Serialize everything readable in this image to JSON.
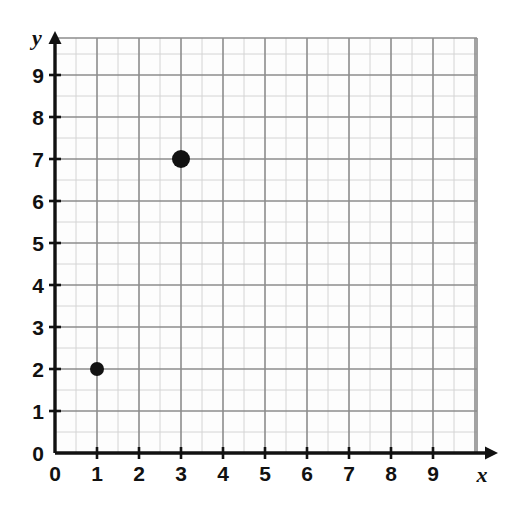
{
  "figure": {
    "title": "",
    "background_color": "#ffffff",
    "width": 507,
    "height": 506
  },
  "chart_data": {
    "type": "scatter",
    "title": "",
    "xlabel": "x",
    "ylabel": "y",
    "xlim": [
      0,
      10
    ],
    "ylim": [
      0,
      9.9
    ],
    "xticks": [
      0,
      1,
      2,
      3,
      4,
      5,
      6,
      7,
      8,
      9
    ],
    "yticks": [
      0,
      1,
      2,
      3,
      4,
      5,
      6,
      7,
      8,
      9
    ],
    "xtick_labels": [
      "0",
      "1",
      "2",
      "3",
      "4",
      "5",
      "6",
      "7",
      "8",
      "9"
    ],
    "ytick_labels": [
      "0",
      "1",
      "2",
      "3",
      "4",
      "5",
      "6",
      "7",
      "8",
      "9"
    ],
    "grid": true,
    "grid_major_step": 1,
    "grid_minor_step": 0.5,
    "legend": null,
    "series": [
      {
        "name": "plotted points",
        "marker": "filled-circle",
        "color": "#121212",
        "points": [
          {
            "label": "(1, 2)",
            "x": 1,
            "y": 2,
            "radius": 7
          },
          {
            "label": "(3, 7)",
            "x": 3,
            "y": 7,
            "radius": 9
          }
        ]
      }
    ]
  },
  "style": {
    "axis_color": "#111111",
    "grid_major_color": "#8c8c8c",
    "grid_minor_color": "#d4d4d4",
    "point_color": "#121212",
    "plot_background": "#fdfdfd"
  },
  "geometry": {
    "origin_x": 55,
    "origin_y": 453,
    "unit_px": 42,
    "grid_right": 477,
    "grid_top": 38,
    "x_arrow_tip": 498,
    "y_arrow_tip": 31
  },
  "labels": {
    "x_axis_name": "x",
    "y_axis_name": "y"
  }
}
